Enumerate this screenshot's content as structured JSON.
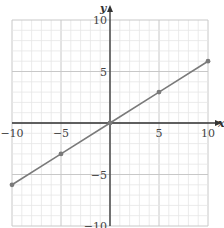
{
  "chart_data": {
    "type": "line",
    "title": "",
    "xlabel": "x",
    "ylabel": "y",
    "xlim": [
      -10,
      10
    ],
    "ylim": [
      -10,
      10
    ],
    "grid": true,
    "minor_grid_step": 1,
    "major_grid_step": 5,
    "x_ticks": [
      -10,
      -5,
      5,
      10
    ],
    "y_ticks": [
      10,
      5,
      -5,
      -10
    ],
    "x_tick_labels": [
      "−10",
      "−5",
      "5",
      "10"
    ],
    "y_tick_labels": [
      "10",
      "5",
      "−5",
      "−10"
    ],
    "series": [
      {
        "name": "line",
        "x": [
          -10,
          -5,
          0,
          5,
          10
        ],
        "y": [
          -6,
          -3,
          0,
          3,
          6
        ],
        "color": "#7a7a7a",
        "markers": true
      }
    ],
    "legend": null
  },
  "colors": {
    "minor_grid": "#e6e6e6",
    "major_grid": "#c8c8c8",
    "axis": "#333333",
    "line": "#7a7a7a",
    "marker": "#7a7a7a"
  },
  "labels": {
    "x_axis": "x",
    "y_axis": "y"
  }
}
